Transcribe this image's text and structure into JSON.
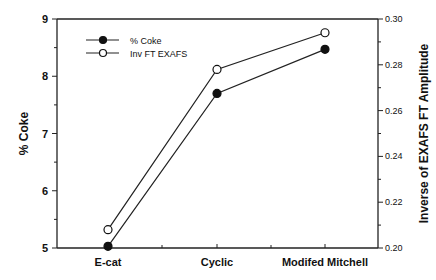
{
  "chart_data": {
    "type": "line",
    "title": "",
    "categories": [
      "E-cat",
      "Cyclic",
      "Modifed  Mitchell"
    ],
    "xlabel": "",
    "ylabel": "% Coke",
    "y2label": "Inverse of EXAFS FT Amplitude",
    "ylim": [
      5,
      9
    ],
    "y2lim": [
      0.2,
      0.3
    ],
    "yticks": [
      "5",
      "6",
      "7",
      "8",
      "9"
    ],
    "y2ticks": [
      "0.20",
      "0.22",
      "0.24",
      "0.26",
      "0.28",
      "0.30"
    ],
    "series": [
      {
        "name": "% Coke",
        "axis": "left",
        "marker": "filled-circle",
        "values": [
          5.03,
          7.7,
          8.47
        ]
      },
      {
        "name": "Inv FT EXAFS",
        "axis": "right",
        "marker": "open-circle",
        "values": [
          0.208,
          0.278,
          0.294
        ]
      }
    ],
    "legend_position": "upper-left",
    "grid": false
  }
}
